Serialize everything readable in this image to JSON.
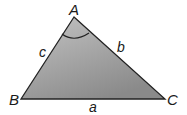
{
  "figure": {
    "type": "triangle",
    "vertices": {
      "A": {
        "label": "A",
        "x": 74,
        "y": 17
      },
      "B": {
        "label": "B",
        "x": 21,
        "y": 99
      },
      "C": {
        "label": "C",
        "x": 165,
        "y": 99
      }
    },
    "sides": {
      "a": {
        "label": "a",
        "between": "B-C"
      },
      "b": {
        "label": "b",
        "between": "A-C"
      },
      "c": {
        "label": "c",
        "between": "A-B"
      }
    },
    "angle_marker": {
      "at": "A"
    },
    "colors": {
      "fill_top": "#c2c2c2",
      "fill_bottom": "#8c8c8c",
      "stroke": "#222222"
    }
  }
}
